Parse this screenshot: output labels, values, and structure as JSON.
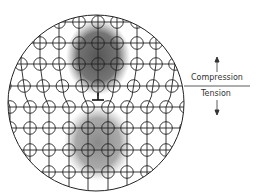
{
  "diagram": {
    "labels": {
      "compression": "Compression",
      "tension": "Tension"
    },
    "colors": {
      "compression_region": "#5a5a5a",
      "tension_region": "#8f8f8f",
      "lattice_lines": "#222222",
      "background": "#ffffff"
    },
    "elements": [
      "boundary-circle",
      "lattice-grid",
      "atom-circles",
      "dislocation-symbol",
      "compression-region",
      "tension-region",
      "divider-line",
      "up-arrow",
      "down-arrow"
    ]
  }
}
